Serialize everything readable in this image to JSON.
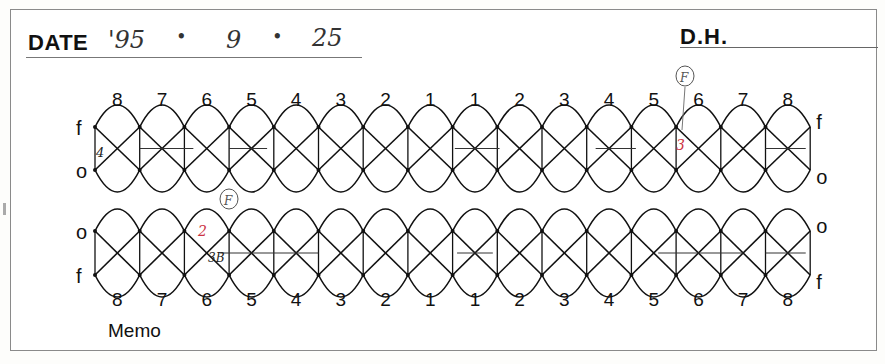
{
  "header": {
    "date_label": "DATE",
    "date_value": {
      "year": "'95",
      "month": "9",
      "day": "25",
      "separator": "•"
    },
    "dh_label": "D.H."
  },
  "chart": {
    "upper": {
      "teeth_labels": [
        "8",
        "7",
        "6",
        "5",
        "4",
        "3",
        "2",
        "1",
        "1",
        "2",
        "3",
        "4",
        "5",
        "6",
        "7",
        "8"
      ],
      "top_side_label": "f",
      "bottom_side_label": "o",
      "right_top_label": "f",
      "right_bottom_label": "o",
      "annotations": [
        {
          "tooth_index": 0,
          "text": "4",
          "color": "#222222"
        },
        {
          "tooth_index": 13,
          "text": "F",
          "color": "#555555",
          "circled": true
        },
        {
          "tooth_index": 13,
          "text": "3",
          "color": "#cc3344"
        }
      ]
    },
    "lower": {
      "teeth_labels": [
        "8",
        "7",
        "6",
        "5",
        "4",
        "3",
        "2",
        "1",
        "1",
        "2",
        "3",
        "4",
        "5",
        "6",
        "7",
        "8"
      ],
      "top_side_label": "o",
      "bottom_side_label": "f",
      "right_top_label": "o",
      "right_bottom_label": "f",
      "annotations": [
        {
          "tooth_index": 2,
          "text": "F",
          "color": "#555555",
          "circled": true
        },
        {
          "tooth_index": 2,
          "text": "2",
          "color": "#cc3344"
        },
        {
          "tooth_index": 2,
          "text": "3B",
          "color": "#222222"
        }
      ]
    }
  },
  "footer": {
    "memo_label": "Memo"
  }
}
